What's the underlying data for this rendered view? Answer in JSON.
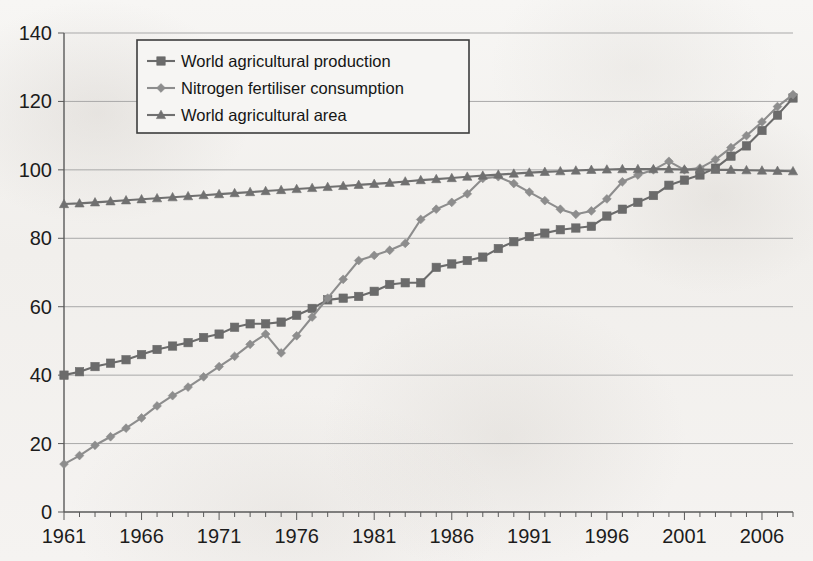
{
  "chart_data": {
    "type": "line",
    "title": "",
    "xlabel": "",
    "ylabel": "",
    "xlim": [
      1961,
      2008
    ],
    "ylim": [
      0,
      140
    ],
    "grid": true,
    "legend_position": "top-left-inside",
    "y_ticks": [
      0,
      20,
      40,
      60,
      80,
      100,
      120,
      140
    ],
    "y_tick_labels": [
      "0",
      "20",
      "40",
      "60",
      "80",
      "100",
      "120",
      "140"
    ],
    "x_tick_labels": [
      "1961",
      "1966",
      "1971",
      "1976",
      "1981",
      "1986",
      "1991",
      "1996",
      "2001",
      "2006"
    ],
    "x_tick_label_years": [
      1961,
      1966,
      1971,
      1976,
      1981,
      1986,
      1991,
      1996,
      2001,
      2006
    ],
    "x_minor_tick_interval": 1,
    "index_note": "Index, 1999-2001 = 100",
    "x": [
      1961,
      1962,
      1963,
      1964,
      1965,
      1966,
      1967,
      1968,
      1969,
      1970,
      1971,
      1972,
      1973,
      1974,
      1975,
      1976,
      1977,
      1978,
      1979,
      1980,
      1981,
      1982,
      1983,
      1984,
      1985,
      1986,
      1987,
      1988,
      1989,
      1990,
      1991,
      1992,
      1993,
      1994,
      1995,
      1996,
      1997,
      1998,
      1999,
      2000,
      2001,
      2002,
      2003,
      2004,
      2005,
      2006,
      2007,
      2008
    ],
    "series": [
      {
        "name": "World agricultural production",
        "marker": "square",
        "color": "#6b6b6b",
        "values": [
          40,
          41,
          42.5,
          43.5,
          44.5,
          46,
          47.5,
          48.5,
          49.5,
          51,
          52,
          54,
          55,
          55,
          55.5,
          57.5,
          59.5,
          62,
          62.5,
          63,
          64.5,
          66.5,
          67,
          67,
          71.5,
          72.5,
          73.5,
          74.5,
          77,
          79,
          80.5,
          81.5,
          82.5,
          83,
          83.5,
          86.5,
          88.5,
          90.5,
          92.5,
          95.5,
          97,
          98.5,
          100.5,
          104,
          107,
          111.5,
          116,
          121
        ]
      },
      {
        "name": "Nitrogen fertiliser consumption",
        "marker": "diamond",
        "color": "#8d8d8d",
        "values": [
          14,
          16.5,
          19.5,
          22,
          24.5,
          27.5,
          31,
          34,
          36.5,
          39.5,
          42.5,
          45.5,
          49,
          52,
          46.5,
          51.5,
          57,
          62.5,
          68,
          73.5,
          75,
          76.5,
          78.5,
          85.5,
          88.5,
          90.5,
          93,
          97.5,
          98,
          96,
          93.5,
          91,
          88.5,
          87,
          88,
          91.5,
          96.5,
          98.5,
          100,
          102.5,
          100,
          100.5,
          103,
          106.5,
          110,
          114,
          118.5,
          122
        ]
      },
      {
        "name": "World agricultural area",
        "marker": "triangle",
        "color": "#707070",
        "values": [
          90,
          90.2,
          90.5,
          90.8,
          91.1,
          91.4,
          91.7,
          92,
          92.3,
          92.6,
          92.9,
          93.2,
          93.5,
          93.8,
          94.1,
          94.4,
          94.7,
          95,
          95.3,
          95.6,
          95.9,
          96.2,
          96.6,
          97,
          97.3,
          97.6,
          98,
          98.3,
          98.6,
          98.9,
          99.2,
          99.4,
          99.6,
          99.8,
          100,
          100.1,
          100.2,
          100.2,
          100.2,
          100.2,
          100.1,
          100.1,
          100,
          100,
          99.9,
          99.8,
          99.7,
          99.6
        ]
      }
    ]
  },
  "legend": {
    "entries": [
      "World agricultural production",
      "Nitrogen fertiliser consumption",
      "World agricultural area"
    ]
  }
}
